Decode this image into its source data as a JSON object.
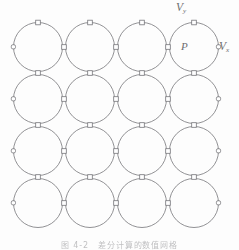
{
  "figure": {
    "type": "lattice-diagram",
    "caption": "图 4-2　差分计算的数值网格",
    "labels": {
      "voltage_y": {
        "symbol": "V",
        "subscript": "y",
        "x": 176,
        "y": 2
      },
      "voltage_x": {
        "symbol": "V",
        "subscript": "x",
        "x": 219,
        "y": 41
      },
      "node_p": {
        "symbol": "P",
        "x": 181,
        "y": 41
      }
    },
    "colors": {
      "stroke": "#76767a",
      "label": "#6e6e70",
      "background": "#fdfdfd",
      "port_fill": "#ffffff",
      "caption": "#8d8d90"
    },
    "grid": {
      "rows": 4,
      "columns": 4,
      "circle_radius": 24.5,
      "column_centers_x": [
        38,
        90,
        142,
        194
      ],
      "row_centers_y": [
        47,
        99,
        151,
        203
      ],
      "stroke_width": 0.8
    },
    "ports": {
      "square_size": 4.6,
      "circle_radius": 2.3,
      "top_row_ports_x": [
        38,
        90,
        142,
        194
      ],
      "top_row_port_y": 22.5,
      "left_edge_ports_y": [
        47,
        99,
        151,
        203
      ],
      "left_edge_port_x": 13.5,
      "right_edge_ports_y": [
        47,
        99,
        151,
        203
      ],
      "right_edge_port_x": 218.5,
      "interior_horizontal_x": [
        64,
        116,
        168
      ],
      "interior_vertical_y": [
        73,
        125,
        177
      ]
    }
  }
}
